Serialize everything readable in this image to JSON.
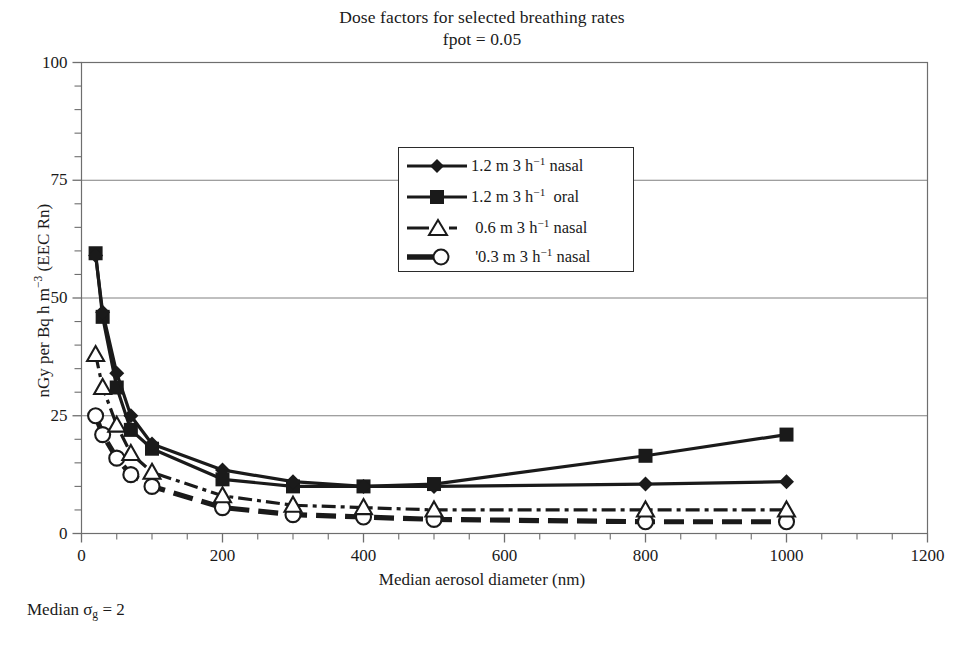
{
  "title": {
    "line1": "Dose factors for selected breathing rates",
    "line2": "fpot = 0.05"
  },
  "footnote": "Median σg = 2",
  "axes": {
    "x_label": "Median aerosol diameter (nm)",
    "y_label": "nGy per Bq h m−3 (EEC Rn)",
    "x_ticks": [
      "0",
      "200",
      "400",
      "600",
      "800",
      "1000",
      "1200"
    ],
    "y_ticks": [
      "0",
      "25",
      "50",
      "75",
      "100"
    ]
  },
  "legend": {
    "items": [
      {
        "label": "1.2 m 3 h−1 nasal",
        "marker": "diamond",
        "line": "solid"
      },
      {
        "label": "1.2 m 3 h−1  oral",
        "marker": "square",
        "line": "solid"
      },
      {
        "label": "0.6 m 3 h−1 nasal",
        "marker": "triangle",
        "line": "dashdot"
      },
      {
        "label": "0.3 m 3 h−1 nasal",
        "marker": "circle",
        "line": "longdash"
      }
    ]
  },
  "colors": {
    "ink": "#1a1a1a",
    "grid": "#808080",
    "frame": "#6e6e6e",
    "background": "#ffffff"
  },
  "chart_data": {
    "type": "line",
    "xlabel": "Median aerosol diameter (nm)",
    "ylabel": "nGy per Bq h m-3 (EEC Rn)",
    "xlim": [
      0,
      1200
    ],
    "ylim": [
      0,
      100
    ],
    "xticks": [
      0,
      200,
      400,
      600,
      800,
      1000,
      1200
    ],
    "yticks": [
      0,
      25,
      50,
      75,
      100
    ],
    "x_minor_step": 50,
    "y_minor_step": 5,
    "grid": "horizontal-major-only",
    "legend_position": "upper-center-inside",
    "annotation": "Median sigma_g = 2",
    "series": [
      {
        "name": "1.2 m 3 h-1 nasal",
        "marker": "diamond",
        "line": "solid",
        "x": [
          20,
          30,
          50,
          70,
          100,
          200,
          300,
          400,
          500,
          800,
          1000
        ],
        "y": [
          59,
          47,
          34,
          25,
          19,
          13.5,
          11,
          10,
          10,
          10.5,
          11
        ]
      },
      {
        "name": "1.2 m 3 h-1 oral",
        "marker": "square",
        "line": "solid",
        "x": [
          20,
          30,
          50,
          70,
          100,
          200,
          300,
          400,
          500,
          800,
          1000
        ],
        "y": [
          59.5,
          46,
          31,
          22,
          18,
          11.5,
          10,
          10,
          10.5,
          16.5,
          21
        ]
      },
      {
        "name": "0.6 m 3 h-1 nasal",
        "marker": "triangle",
        "line": "dashdot",
        "x": [
          20,
          30,
          50,
          70,
          100,
          200,
          300,
          400,
          500,
          800,
          1000
        ],
        "y": [
          38,
          31,
          23,
          17,
          13,
          8,
          6,
          5.5,
          5,
          5,
          5
        ]
      },
      {
        "name": "0.3 m 3 h-1 nasal",
        "marker": "circle",
        "line": "longdash",
        "x": [
          20,
          30,
          50,
          70,
          100,
          200,
          300,
          400,
          500,
          800,
          1000
        ],
        "y": [
          25,
          21,
          16,
          12.5,
          10,
          5.5,
          4,
          3.5,
          3,
          2.5,
          2.5
        ]
      }
    ]
  }
}
